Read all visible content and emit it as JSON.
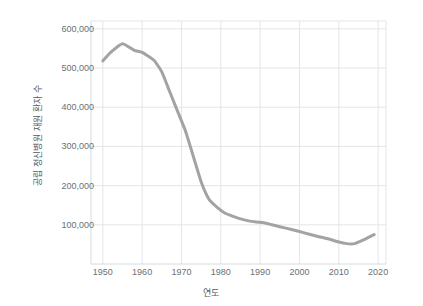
{
  "chart_data": {
    "type": "line",
    "title": "",
    "xlabel": "연도",
    "ylabel": "공립 정신병원 재원 환자 수",
    "xlim": [
      1947,
      2022
    ],
    "ylim": [
      0,
      620000
    ],
    "grid": true,
    "legend": "none",
    "line_color": "#a3a3a3",
    "line_width": 3,
    "xticks": [
      1950,
      1960,
      1970,
      1980,
      1990,
      2000,
      2010,
      2020
    ],
    "xtick_labels": [
      "1950",
      "1960",
      "1970",
      "1980",
      "1990",
      "2000",
      "2010",
      "2020"
    ],
    "yticks": [
      100000,
      200000,
      300000,
      400000,
      500000,
      600000
    ],
    "ytick_labels": [
      "100,000",
      "200,000",
      "300,000",
      "400,000",
      "500,000",
      "600,000"
    ],
    "x": [
      1950,
      1952,
      1955,
      1958,
      1960,
      1963,
      1965,
      1967,
      1969,
      1971,
      1973,
      1975,
      1977,
      1979,
      1981,
      1983,
      1985,
      1987,
      1989,
      1991,
      1993,
      1995,
      1998,
      2001,
      2004,
      2007,
      2010,
      2012,
      2014,
      2016,
      2019
    ],
    "values": [
      518000,
      540000,
      562000,
      545000,
      540000,
      520000,
      490000,
      440000,
      390000,
      340000,
      275000,
      210000,
      165000,
      145000,
      130000,
      122000,
      115000,
      110000,
      107000,
      105000,
      100000,
      95000,
      88000,
      80000,
      72000,
      65000,
      56000,
      52000,
      52000,
      60000,
      75000
    ]
  }
}
